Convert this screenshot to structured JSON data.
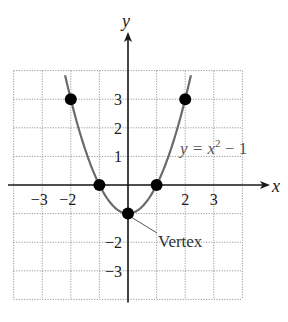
{
  "chart_data": {
    "type": "line",
    "title": "",
    "xlabel": "x",
    "ylabel": "y",
    "xlim": [
      -4,
      4
    ],
    "ylim": [
      -4,
      4
    ],
    "grid": true,
    "x_ticks": [
      {
        "value": -3,
        "label": "−3"
      },
      {
        "value": -2,
        "label": "−2"
      },
      {
        "value": 2,
        "label": "2"
      },
      {
        "value": 3,
        "label": "3"
      }
    ],
    "y_ticks": [
      {
        "value": 3,
        "label": "3"
      },
      {
        "value": 2,
        "label": "2"
      },
      {
        "value": 1,
        "label": "1"
      },
      {
        "value": -2,
        "label": "−2"
      },
      {
        "value": -3,
        "label": "−3"
      }
    ],
    "series": [
      {
        "name": "y = x^2 - 1",
        "function": "x^2 - 1",
        "x": [
          -2.2,
          -2,
          -1.5,
          -1,
          -0.5,
          0,
          0.5,
          1,
          1.5,
          2,
          2.2
        ],
        "y": [
          3.84,
          3,
          1.25,
          0,
          -0.75,
          -1,
          -0.75,
          0,
          1.25,
          3,
          3.84
        ]
      }
    ],
    "points": [
      {
        "x": -2,
        "y": 3
      },
      {
        "x": -1,
        "y": 0
      },
      {
        "x": 0,
        "y": -1
      },
      {
        "x": 1,
        "y": 0
      },
      {
        "x": 2,
        "y": 3
      }
    ],
    "annotations": [
      {
        "text": "Vertex",
        "points_to": {
          "x": 0,
          "y": -1
        }
      }
    ],
    "equation_label": {
      "main": "y = x",
      "sup": "2",
      "tail": " − 1"
    },
    "colors": {
      "curve": "#6b6b6b",
      "points": "#000000",
      "axes": "#1a1a1a",
      "grid": "#9a9a9a",
      "equation": "#555555"
    }
  }
}
